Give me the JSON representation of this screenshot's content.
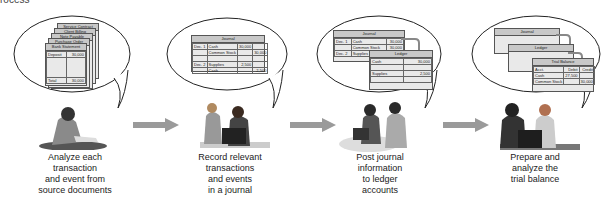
{
  "header": {
    "partial_text": "rocess"
  },
  "steps": [
    {
      "id": "analyze",
      "caption": [
        "Analyze each",
        "transaction",
        "and event from",
        "source documents"
      ],
      "documents": [
        "Service Contract",
        "Client Billing",
        "Note Payable",
        "Purchase Order",
        "Bank Statement"
      ],
      "front_doc": {
        "row1_label": "Deposit",
        "row1_amount": "30,000",
        "total_label": "Total",
        "total_amount": "30,000"
      }
    },
    {
      "id": "record",
      "caption": [
        "Record relevant",
        "transactions",
        "and events",
        "in a journal"
      ],
      "journal": {
        "title": "Journal",
        "rows": [
          {
            "date": "Dec. 1",
            "account": "Cash",
            "debit": "30,000",
            "credit": ""
          },
          {
            "date": "",
            "account": "Common Stock",
            "debit": "",
            "credit": "30,000"
          },
          {
            "date": "",
            "account": "",
            "debit": "",
            "credit": ""
          },
          {
            "date": "Dec. 2",
            "account": "Supplies",
            "debit": "2,500",
            "credit": ""
          },
          {
            "date": "",
            "account": "Cash",
            "debit": "",
            "credit": "2,500"
          }
        ]
      }
    },
    {
      "id": "post",
      "caption": [
        "Post journal",
        "information",
        "to ledger",
        "accounts"
      ],
      "journal_title": "Journal",
      "journal_rows": [
        {
          "date": "Dec. 1",
          "account": "Cash",
          "amount": "30,000"
        },
        {
          "date": "",
          "account": "Common Stock",
          "amount": "30,000"
        },
        {
          "date": "Dec. 2",
          "account": "Supplies",
          "amount": "2,500"
        },
        {
          "date": "",
          "account": "Cash",
          "amount": ""
        }
      ],
      "ledger": {
        "title": "Ledger",
        "accounts": [
          {
            "name": "Cash",
            "amount": "30,000"
          },
          {
            "name": "Supplies",
            "amount": "2,500"
          }
        ]
      }
    },
    {
      "id": "trial-balance",
      "caption": [
        "Prepare and",
        "analyze the",
        "trial balance"
      ],
      "journal_title": "Journal",
      "ledger_title": "Ledger",
      "trial_balance": {
        "title": "Trial Balance",
        "columns": [
          "Acct.",
          "Debit",
          "Credit"
        ],
        "rows": [
          {
            "account": "Cash",
            "debit": "27,500",
            "credit": ""
          },
          {
            "account": "Supplies",
            "debit": "2,500",
            "credit": ""
          },
          {
            "account": "Common Stock",
            "debit": "",
            "credit": "30,000"
          },
          {
            "account": "Totals",
            "debit": "30,000",
            "credit": "30,000"
          }
        ]
      }
    }
  ],
  "colors": {
    "arrow": "#9a9a9a",
    "doc_fill": "#e9e9e9",
    "doc_header": "#c8c8c8",
    "outline": "#555555"
  }
}
